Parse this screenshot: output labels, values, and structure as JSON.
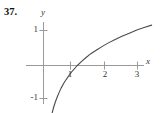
{
  "figure": {
    "problem_number": "37.",
    "background_color": "#ffffff",
    "axis_color": "#9a9a9a",
    "curve_color": "#4a4a4a",
    "text_color": "#333333"
  },
  "chart_data": {
    "type": "line",
    "title": "",
    "xlabel": "x",
    "ylabel": "y",
    "xlim": [
      -0.35,
      3.5
    ],
    "ylim": [
      -1.4,
      1.35
    ],
    "grid": false,
    "legend": null,
    "xticks": [
      1,
      2,
      3
    ],
    "xticklabels": [
      "1",
      "2",
      "3"
    ],
    "yticks": [
      1,
      -1
    ],
    "yticklabels": [
      "1",
      "-1"
    ],
    "series": [
      {
        "name": "y = ln x",
        "x": [
          0.22,
          0.26,
          0.3,
          0.35,
          0.4,
          0.46,
          0.52,
          0.6,
          0.68,
          0.78,
          0.88,
          1.0,
          1.12,
          1.26,
          1.4,
          1.56,
          1.74,
          1.92,
          2.12,
          2.32,
          2.54,
          2.76,
          3.0,
          3.2
        ],
        "values": [
          -1.51,
          -1.35,
          -1.2,
          -1.05,
          -0.92,
          -0.78,
          -0.65,
          -0.51,
          -0.39,
          -0.25,
          -0.13,
          0.0,
          0.11,
          0.23,
          0.34,
          0.44,
          0.55,
          0.65,
          0.75,
          0.84,
          0.93,
          1.02,
          1.1,
          1.16
        ]
      }
    ]
  }
}
